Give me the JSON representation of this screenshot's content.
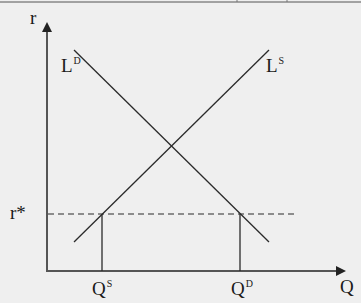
{
  "diagram": {
    "title": "",
    "axes": {
      "y_label": "r",
      "x_label": "Q"
    },
    "curves": [
      {
        "id": "demand",
        "label_base": "L",
        "label_sup": "D",
        "description": "loan demand, downward sloping"
      },
      {
        "id": "supply",
        "label_base": "L",
        "label_sup": "S",
        "description": "loan supply, upward sloping"
      }
    ],
    "reference_line": {
      "label": "r*",
      "style": "dashed"
    },
    "quantity_markers": [
      {
        "label_base": "Q",
        "label_sup": "S"
      },
      {
        "label_base": "Q",
        "label_sup": "D"
      }
    ],
    "colors": {
      "line": "#2a2a2a",
      "background": "#efefef",
      "text": "#1a1a1a"
    }
  }
}
